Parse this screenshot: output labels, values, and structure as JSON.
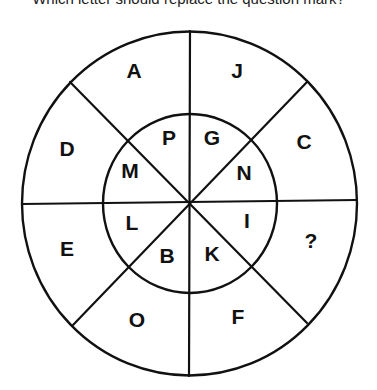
{
  "puzzle": {
    "question": "Which letter should replace the question mark?",
    "outer_ring": {
      "segments": [
        {
          "position": "top-left",
          "letter": "A"
        },
        {
          "position": "top-right",
          "letter": "J"
        },
        {
          "position": "right-upper",
          "letter": "C"
        },
        {
          "position": "right-lower",
          "letter": "?"
        },
        {
          "position": "bottom-right",
          "letter": "F"
        },
        {
          "position": "bottom-left",
          "letter": "O"
        },
        {
          "position": "left-lower",
          "letter": "E"
        },
        {
          "position": "left-upper",
          "letter": "D"
        }
      ]
    },
    "inner_ring": {
      "segments": [
        {
          "position": "top-left",
          "letter": "P"
        },
        {
          "position": "top-right",
          "letter": "G"
        },
        {
          "position": "right-upper",
          "letter": "N"
        },
        {
          "position": "right-lower",
          "letter": "I"
        },
        {
          "position": "bottom-right",
          "letter": "K"
        },
        {
          "position": "bottom-left",
          "letter": "B"
        },
        {
          "position": "left-lower",
          "letter": "L"
        },
        {
          "position": "left-upper",
          "letter": "M"
        }
      ]
    },
    "colors": {
      "ink": "#111111",
      "background": "#ffffff"
    }
  }
}
